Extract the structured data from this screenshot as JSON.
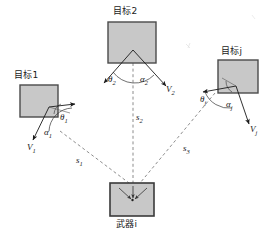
{
  "diagram": {
    "background_color": "#ffffff",
    "stroke_color": "#1a1a1a",
    "box_fill_color": "#c8c8c8",
    "box_border_color": "#4a4a4a",
    "dashed_color": "#707070"
  },
  "targets": [
    {
      "id": "target-1",
      "label": "目标1",
      "theta_label": "θ",
      "theta_sub": "1",
      "alpha_label": "α",
      "alpha_sub": "1",
      "velocity_label": "V",
      "velocity_sub": "1"
    },
    {
      "id": "target-2",
      "label": "目标2",
      "theta_label": "θ",
      "theta_sub": "2",
      "alpha_label": "α",
      "alpha_sub": "2",
      "velocity_label": "V",
      "velocity_sub": "2"
    },
    {
      "id": "target-j",
      "label": "目标j",
      "theta_label": "θ",
      "theta_sub": "j",
      "alpha_label": "α",
      "alpha_sub": "j",
      "velocity_label": "V",
      "velocity_sub": "j"
    }
  ],
  "weapon": {
    "id": "weapon-i",
    "label": "武器i"
  },
  "distances": [
    {
      "id": "range-s1",
      "label": "s",
      "sub": "1"
    },
    {
      "id": "range-s2",
      "label": "s",
      "sub": "2"
    },
    {
      "id": "range-s3",
      "label": "s",
      "sub": "3"
    }
  ]
}
